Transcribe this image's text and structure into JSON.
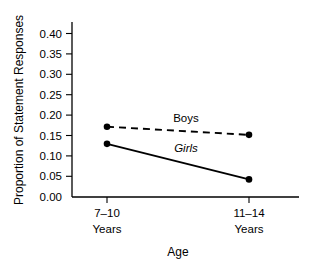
{
  "chart_data": {
    "type": "line",
    "title": "",
    "xlabel": "Age",
    "ylabel": "Proportion of Statement Responses",
    "categories": [
      "7–10\nYears",
      "11–14\nYears"
    ],
    "category_lines": [
      [
        "7–10",
        "Years"
      ],
      [
        "11–14",
        "Years"
      ]
    ],
    "x": [
      0,
      1
    ],
    "ylim": [
      0.0,
      0.425
    ],
    "yticks": [
      0.0,
      0.05,
      0.1,
      0.15,
      0.2,
      0.25,
      0.3,
      0.35,
      0.4
    ],
    "ytick_labels": [
      "0.00",
      "0.05",
      "0.10",
      "0.15",
      "0.20",
      "0.25",
      "0.30",
      "0.35",
      "0.40"
    ],
    "grid": false,
    "legend_position": "inline-annotation",
    "series": [
      {
        "name": "Boys",
        "label_style": "normal",
        "linestyle": "dashed",
        "marker": "filled-circle",
        "color": "#000000",
        "values": [
          0.172,
          0.152
        ]
      },
      {
        "name": "Girls",
        "label_style": "italic",
        "linestyle": "solid",
        "marker": "filled-circle",
        "color": "#000000",
        "values": [
          0.13,
          0.043
        ]
      }
    ],
    "annotations": [
      {
        "text": "Boys",
        "series": "Boys",
        "style": "normal"
      },
      {
        "text": "Girls",
        "series": "Girls",
        "style": "italic"
      }
    ]
  }
}
